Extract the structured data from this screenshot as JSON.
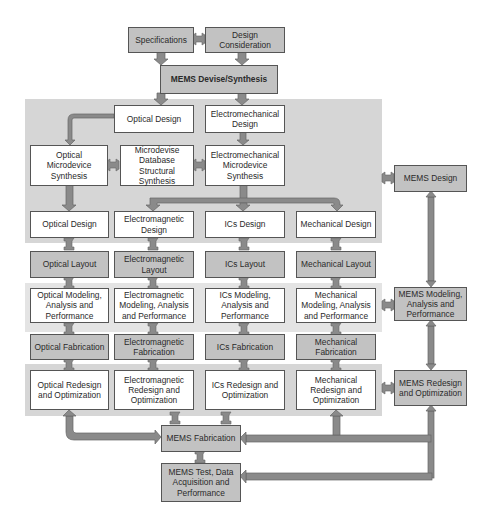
{
  "colors": {
    "panel": "#d6d6d6",
    "panel_light": "#e4e4e4",
    "box_white": "#ffffff",
    "box_gray": "#c2c2c2",
    "arrow": "#8a8a8a",
    "border": "#555555",
    "text": "#2a2a2a"
  },
  "top": {
    "specifications": "Specifications",
    "design_consideration": "Design Consideration",
    "mems_devise": "MEMS Devise/Synthesis"
  },
  "synthesis": {
    "optical_design": "Optical Design",
    "electromechanical_design": "Electromechanical Design",
    "optical_microdevice_synthesis": "Optical Microdevice Synthesis",
    "microdevise_database": "Microdevise Database Structural Synthesis",
    "electromechanical_microdevice_synthesis": "Electromechanical Microdevice Synthesis"
  },
  "columns": [
    {
      "design": "Optical Design",
      "layout": "Optical Layout",
      "modeling": "Optical Modeling, Analysis and Performance",
      "fabrication": "Optical Fabrication",
      "redesign": "Optical Redesign and Optimization"
    },
    {
      "design": "Electromagnetic Design",
      "layout": "Electromagnetic Layout",
      "modeling": "Electromagnetic Modeling, Analysis and Performance",
      "fabrication": "Electromagnetic Fabrication",
      "redesign": "Electromagnetic Redesign and Optimization"
    },
    {
      "design": "ICs Design",
      "layout": "ICs Layout",
      "modeling": "ICs Modeling, Analysis and Performance",
      "fabrication": "ICs Fabrication",
      "redesign": "ICs Redesign and Optimization"
    },
    {
      "design": "Mechanical Design",
      "layout": "Mechanical Layout",
      "modeling": "Mechanical Modeling, Analysis and Performance",
      "fabrication": "Mechanical Fabrication",
      "redesign": "Mechanical Redesign and Optimization"
    }
  ],
  "right": {
    "mems_design": "MEMS Design",
    "mems_modeling": "MEMS Modeling, Analysis and Performance",
    "mems_redesign": "MEMS Redesign and Optimization"
  },
  "bottom": {
    "mems_fabrication": "MEMS Fabrication",
    "mems_test": "MEMS Test, Data Acquisition and Performance"
  }
}
